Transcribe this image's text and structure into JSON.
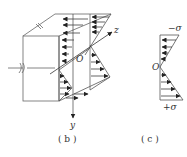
{
  "figure_b": {
    "caption": "( b )",
    "axis_z": "z",
    "axis_y": "y",
    "origin": "O"
  },
  "figure_c": {
    "caption": "( c )",
    "top_label": "−σ",
    "origin": "O",
    "bottom_label": "+σ"
  },
  "colors": {
    "line": "#555555",
    "arrow": "#333333",
    "background": "#ffffff"
  }
}
